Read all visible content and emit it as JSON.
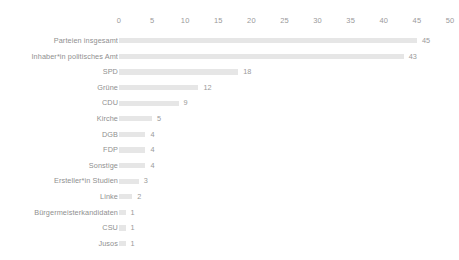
{
  "chart_data": {
    "type": "bar",
    "orientation": "horizontal",
    "title": "",
    "subtitle": "",
    "xlabel": "",
    "ylabel": "",
    "xlim": [
      0,
      50
    ],
    "xticks": [
      0,
      5,
      10,
      15,
      20,
      25,
      30,
      35,
      40,
      45,
      50
    ],
    "xtick_labels": [
      "0",
      "5",
      "10",
      "15",
      "20",
      "25",
      "30",
      "35",
      "40",
      "45",
      "50"
    ],
    "grid": false,
    "legend": null,
    "bar_color": "#e6e6e6",
    "label_color": "#8f8f8f",
    "value_label_color": "#9a9a9a",
    "axis_label_color": "#9a9a9a",
    "background_color": "#ffffff",
    "show_value_labels": true,
    "categories": [
      "Parteien insgesamt",
      "Inhaber*in politisches Amt",
      "SPD",
      "Grüne",
      "CDU",
      "Kirche",
      "DGB",
      "FDP",
      "Sonstige",
      "Ersteller*in Studien",
      "Linke",
      "Bürgermeisterkandidaten",
      "CSU",
      "Jusos"
    ],
    "values": [
      45,
      43,
      18,
      12,
      9,
      5,
      4,
      4,
      4,
      3,
      2,
      1,
      1,
      1
    ],
    "value_labels": [
      "45",
      "43",
      "18",
      "12",
      "9",
      "5",
      "4",
      "4",
      "4",
      "3",
      "2",
      "1",
      "1",
      "1"
    ]
  }
}
